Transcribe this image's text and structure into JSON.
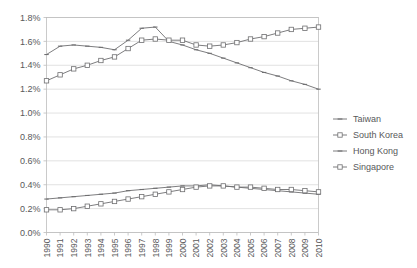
{
  "chart_data": {
    "type": "line",
    "title": "",
    "xlabel": "",
    "ylabel": "",
    "grid": true,
    "legend_position": "right",
    "x": [
      1990,
      1991,
      1992,
      1993,
      1994,
      1995,
      1996,
      1997,
      1998,
      1999,
      2000,
      2001,
      2002,
      2003,
      2004,
      2005,
      2006,
      2007,
      2008,
      2009,
      2010
    ],
    "categories": [
      "1990",
      "1991",
      "1992",
      "1993",
      "1994",
      "1995",
      "1996",
      "1997",
      "1998",
      "1999",
      "2000",
      "2001",
      "2002",
      "2003",
      "2004",
      "2005",
      "2006",
      "2007",
      "2008",
      "2009",
      "2010"
    ],
    "ylim": [
      0.0,
      1.8
    ],
    "yticks": [
      0.0,
      0.2,
      0.4,
      0.6,
      0.8,
      1.0,
      1.2,
      1.4,
      1.6,
      1.8
    ],
    "ytick_labels": [
      "0.0%",
      "0.2%",
      "0.4%",
      "0.6%",
      "0.8%",
      "1.0%",
      "1.2%",
      "1.4%",
      "1.6%",
      "1.8%"
    ],
    "units": "percent",
    "series": [
      {
        "name": "Taiwan",
        "marker": "dash",
        "values": [
          1.49,
          1.56,
          1.57,
          1.56,
          1.55,
          1.53,
          1.61,
          1.71,
          1.72,
          1.6,
          1.57,
          1.53,
          1.5,
          1.46,
          1.42,
          1.38,
          1.34,
          1.31,
          1.27,
          1.24,
          1.2
        ]
      },
      {
        "name": "South Korea",
        "marker": "square",
        "values": [
          1.27,
          1.32,
          1.37,
          1.4,
          1.44,
          1.47,
          1.54,
          1.61,
          1.62,
          1.61,
          1.61,
          1.57,
          1.56,
          1.57,
          1.59,
          1.62,
          1.64,
          1.67,
          1.7,
          1.71,
          1.72
        ]
      },
      {
        "name": "Hong Kong",
        "marker": "dash",
        "values": [
          0.28,
          0.29,
          0.3,
          0.31,
          0.32,
          0.33,
          0.35,
          0.36,
          0.37,
          0.38,
          0.39,
          0.39,
          0.4,
          0.39,
          0.38,
          0.37,
          0.36,
          0.35,
          0.34,
          0.33,
          0.32
        ]
      },
      {
        "name": "Singapore",
        "marker": "square",
        "values": [
          0.19,
          0.19,
          0.2,
          0.22,
          0.24,
          0.26,
          0.28,
          0.3,
          0.32,
          0.34,
          0.36,
          0.38,
          0.39,
          0.39,
          0.38,
          0.38,
          0.37,
          0.36,
          0.36,
          0.35,
          0.34
        ]
      }
    ]
  },
  "legend": {
    "items": [
      {
        "label": "Taiwan"
      },
      {
        "label": "South Korea"
      },
      {
        "label": "Hong Kong"
      },
      {
        "label": "Singapore"
      }
    ]
  },
  "colors": {
    "line": "#6e6e70",
    "grid": "#d9d9d9",
    "frame": "#bdbdbd",
    "text": "#58585a",
    "background": "#ffffff"
  }
}
